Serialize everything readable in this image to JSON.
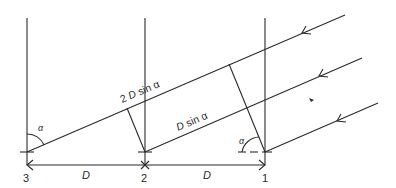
{
  "diagram": {
    "title": "",
    "sensors": [
      {
        "id": "3",
        "label": "3"
      },
      {
        "id": "2",
        "label": "2"
      },
      {
        "id": "1",
        "label": "1"
      }
    ],
    "spacing_labels": [
      "D",
      "D"
    ],
    "path_labels": {
      "long": {
        "prefix": "2 ",
        "var": "D",
        "suffix": " sin α"
      },
      "short": {
        "prefix": "",
        "var": "D",
        "suffix": " sin α"
      }
    },
    "angle_label": "α",
    "incoming_rays": 3,
    "colors": {
      "line": "#2a2a2a",
      "background": "#ffffff"
    }
  }
}
